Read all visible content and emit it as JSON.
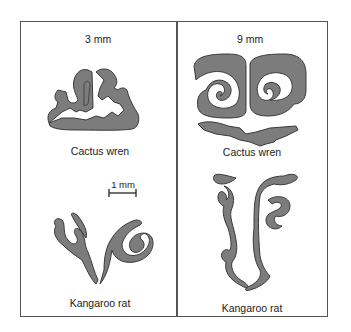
{
  "figure": {
    "panels": [
      {
        "id": "left",
        "size_label": "3 mm",
        "top_specimen": "Cactus wren",
        "bottom_specimen": "Kangaroo rat",
        "scale_bar_label": "1 mm"
      },
      {
        "id": "right",
        "size_label": "9 mm",
        "top_specimen": "Cactus wren",
        "bottom_specimen": "Kangaroo rat"
      }
    ],
    "colors": {
      "fill": "#7c7c7c",
      "outline": "#3a3a3a",
      "frame": "#555555",
      "background": "#ffffff"
    }
  }
}
